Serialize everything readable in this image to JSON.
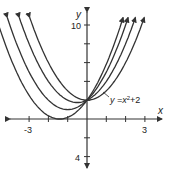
{
  "axes": {
    "x_label": "x",
    "y_label": "y",
    "x_tick_labels": {
      "neg": "-3",
      "pos": "3"
    },
    "y_tick_labels": {
      "top": "10",
      "bottom": "4"
    },
    "x_range": [
      -3.5,
      3.5
    ],
    "y_range": [
      -4.5,
      11
    ]
  },
  "curve_label": {
    "prefix": "y =x",
    "exp": "2",
    "suffix": "+2"
  },
  "curves": [
    {
      "equation": "y = x^2 + 2",
      "b": 0
    },
    {
      "equation": "y = x^2 + x + 2",
      "b": 1
    },
    {
      "equation": "y = x^2 + 2x + 2",
      "b": 2
    },
    {
      "equation": "y = x^2 + 2.83x + 2",
      "b": 2.83
    }
  ],
  "colors": {
    "stroke": "#333333",
    "background": "#ffffff"
  }
}
